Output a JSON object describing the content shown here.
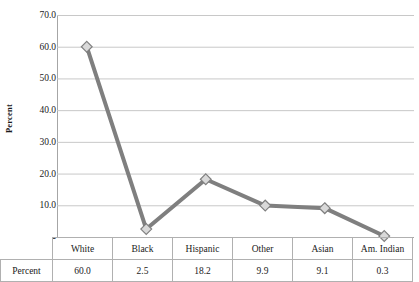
{
  "chart_data": {
    "type": "line",
    "title": "",
    "xlabel": "",
    "ylabel": "Percent",
    "categories": [
      "White",
      "Black",
      "Hispanic",
      "Other",
      "Asian",
      "Am. Indian"
    ],
    "values": [
      60.0,
      2.5,
      18.2,
      9.9,
      9.1,
      0.3
    ],
    "series": [
      {
        "name": "Percent",
        "values": [
          60.0,
          2.5,
          18.2,
          9.9,
          9.1,
          0.3
        ]
      }
    ],
    "value_labels": [
      "60.0",
      "2.5",
      "18.2",
      "9.9",
      "9.1",
      "0.3"
    ],
    "ylim": [
      0,
      70
    ],
    "ytick_values": [
      70.0,
      60.0,
      50.0,
      40.0,
      30.0,
      20.0,
      10.0,
      0
    ],
    "ytick_labels": [
      "70.0",
      "60.0",
      "50.0",
      "40.0",
      "30.0",
      "20.0",
      "10.0",
      "-"
    ],
    "grid": true,
    "legend": false,
    "legend_position": "none",
    "marker": "diamond",
    "colors": {
      "line": "#7f7f7f",
      "marker_fill": "#d9d9d9",
      "marker_border": "#808080",
      "gridline": "#c8c8c8",
      "axis": "#a6a6a6",
      "table_border": "#b0b0b0",
      "text": "#1a1a1a"
    }
  },
  "data_table": {
    "row_label": "Percent",
    "headers": [
      "White",
      "Black",
      "Hispanic",
      "Other",
      "Asian",
      "Am. Indian"
    ],
    "values": [
      "60.0",
      "2.5",
      "18.2",
      "9.9",
      "9.1",
      "0.3"
    ]
  }
}
